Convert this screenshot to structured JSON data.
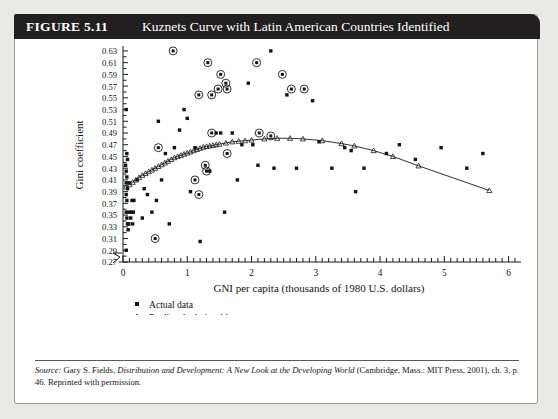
{
  "figure": {
    "number": "FIGURE 5.11",
    "title": "Kuznets Curve with Latin American Countries Identified"
  },
  "source": {
    "label": "Source:",
    "author": " Gary S. Fields, ",
    "work_italic": "Distribution and Development: A New Look at the Developing World",
    "rest": " (Cambridge, Mass.: MIT Press, 2001), ch. 3, p. 46. Reprinted with permission."
  },
  "legend": {
    "items": [
      {
        "marker": "square-marker",
        "label": "Actual data"
      },
      {
        "marker": "triangle-marker",
        "label": "Predicted relationship"
      },
      {
        "marker": "circled-square-marker",
        "label": "Latin American country"
      }
    ]
  },
  "colors": {
    "header_bg": "#211f1f",
    "header_text": "#ffffff",
    "axis": "#1a1a1a",
    "marker": "#141414",
    "page_bg": "#e9e9e7",
    "card_bg": "#ffffff"
  },
  "chart_data": {
    "type": "scatter",
    "title": "Kuznets Curve with Latin American Countries Identified",
    "xlabel": "GNI per capita (thousands of 1980 U.S. dollars)",
    "ylabel": "Gini coefficient",
    "xlim": [
      0,
      6.1
    ],
    "ylim": [
      0.27,
      0.635
    ],
    "xticks": [
      0,
      1,
      2,
      3,
      4,
      5,
      6
    ],
    "xtick_labels": [
      "0",
      "1",
      "2",
      "3",
      "4",
      "5",
      "6"
    ],
    "x_minor_tick_step": 0.1,
    "yticks": [
      0.27,
      0.29,
      0.31,
      0.33,
      0.35,
      0.37,
      0.39,
      0.41,
      0.43,
      0.45,
      0.47,
      0.49,
      0.51,
      0.53,
      0.55,
      0.57,
      0.59,
      0.61,
      0.63
    ],
    "ytick_labels": [
      "0.27",
      "0.29",
      "0.31",
      "0.33",
      "0.35",
      "0.37",
      "0.39",
      "0.41",
      "0.43",
      "0.45",
      "0.47",
      "0.49",
      "0.51",
      "0.53",
      "0.55",
      "0.57",
      "0.59",
      "0.61",
      "0.63"
    ],
    "grid": false,
    "axis_break_origin": true,
    "legend_position": "below-left",
    "series": [
      {
        "name": "Actual data",
        "marker": "square",
        "points": [
          [
            0.05,
            0.53
          ],
          [
            0.06,
            0.455
          ],
          [
            0.07,
            0.445
          ],
          [
            0.04,
            0.435
          ],
          [
            0.05,
            0.425
          ],
          [
            0.06,
            0.415
          ],
          [
            0.05,
            0.405
          ],
          [
            0.1,
            0.405
          ],
          [
            0.07,
            0.395
          ],
          [
            0.05,
            0.385
          ],
          [
            0.06,
            0.375
          ],
          [
            0.14,
            0.375
          ],
          [
            0.17,
            0.375
          ],
          [
            0.05,
            0.355
          ],
          [
            0.09,
            0.355
          ],
          [
            0.13,
            0.355
          ],
          [
            0.16,
            0.355
          ],
          [
            0.06,
            0.345
          ],
          [
            0.07,
            0.335
          ],
          [
            0.09,
            0.335
          ],
          [
            0.08,
            0.325
          ],
          [
            0.05,
            0.29
          ],
          [
            0.12,
            0.345
          ],
          [
            0.15,
            0.335
          ],
          [
            0.22,
            0.41
          ],
          [
            0.3,
            0.345
          ],
          [
            0.33,
            0.395
          ],
          [
            0.38,
            0.385
          ],
          [
            0.45,
            0.355
          ],
          [
            0.52,
            0.375
          ],
          [
            0.55,
            0.51
          ],
          [
            0.6,
            0.41
          ],
          [
            0.66,
            0.455
          ],
          [
            0.72,
            0.335
          ],
          [
            0.8,
            0.465
          ],
          [
            0.88,
            0.495
          ],
          [
            0.95,
            0.53
          ],
          [
            1.0,
            0.515
          ],
          [
            1.05,
            0.39
          ],
          [
            1.12,
            0.465
          ],
          [
            1.2,
            0.305
          ],
          [
            1.35,
            0.425
          ],
          [
            1.45,
            0.49
          ],
          [
            1.52,
            0.49
          ],
          [
            1.58,
            0.355
          ],
          [
            1.7,
            0.49
          ],
          [
            1.78,
            0.41
          ],
          [
            1.85,
            0.47
          ],
          [
            1.95,
            0.575
          ],
          [
            2.02,
            0.47
          ],
          [
            2.1,
            0.435
          ],
          [
            2.3,
            0.63
          ],
          [
            2.35,
            0.43
          ],
          [
            2.55,
            0.555
          ],
          [
            2.7,
            0.43
          ],
          [
            2.95,
            0.545
          ],
          [
            3.05,
            0.475
          ],
          [
            3.25,
            0.43
          ],
          [
            3.45,
            0.465
          ],
          [
            3.55,
            0.46
          ],
          [
            3.62,
            0.39
          ],
          [
            3.75,
            0.43
          ],
          [
            4.1,
            0.455
          ],
          [
            4.3,
            0.47
          ],
          [
            4.55,
            0.445
          ],
          [
            4.95,
            0.465
          ],
          [
            5.35,
            0.43
          ],
          [
            5.6,
            0.455
          ]
        ]
      },
      {
        "name": "Predicted relationship",
        "marker": "triangle",
        "line": true,
        "points": [
          [
            0.05,
            0.398
          ],
          [
            0.1,
            0.402
          ],
          [
            0.15,
            0.406
          ],
          [
            0.2,
            0.41
          ],
          [
            0.25,
            0.414
          ],
          [
            0.3,
            0.418
          ],
          [
            0.35,
            0.421
          ],
          [
            0.4,
            0.424
          ],
          [
            0.45,
            0.427
          ],
          [
            0.5,
            0.43
          ],
          [
            0.55,
            0.433
          ],
          [
            0.6,
            0.436
          ],
          [
            0.65,
            0.439
          ],
          [
            0.7,
            0.442
          ],
          [
            0.75,
            0.445
          ],
          [
            0.8,
            0.448
          ],
          [
            0.85,
            0.45
          ],
          [
            0.9,
            0.452
          ],
          [
            0.95,
            0.454
          ],
          [
            1.0,
            0.456
          ],
          [
            1.05,
            0.458
          ],
          [
            1.1,
            0.46
          ],
          [
            1.15,
            0.462
          ],
          [
            1.2,
            0.464
          ],
          [
            1.25,
            0.466
          ],
          [
            1.3,
            0.467
          ],
          [
            1.35,
            0.468
          ],
          [
            1.4,
            0.469
          ],
          [
            1.45,
            0.47
          ],
          [
            1.5,
            0.471
          ],
          [
            1.6,
            0.473
          ],
          [
            1.7,
            0.475
          ],
          [
            1.8,
            0.476
          ],
          [
            1.9,
            0.477
          ],
          [
            2.0,
            0.478
          ],
          [
            2.2,
            0.48
          ],
          [
            2.4,
            0.481
          ],
          [
            2.6,
            0.481
          ],
          [
            2.8,
            0.48
          ],
          [
            3.1,
            0.477
          ],
          [
            3.4,
            0.472
          ],
          [
            3.6,
            0.468
          ],
          [
            3.9,
            0.46
          ],
          [
            4.2,
            0.45
          ],
          [
            4.6,
            0.434
          ],
          [
            5.7,
            0.392
          ]
        ]
      },
      {
        "name": "Latin American country",
        "marker": "circled-square",
        "points": [
          [
            0.78,
            0.63
          ],
          [
            1.32,
            0.61
          ],
          [
            1.52,
            0.59
          ],
          [
            1.6,
            0.575
          ],
          [
            1.48,
            0.565
          ],
          [
            1.62,
            0.565
          ],
          [
            1.18,
            0.555
          ],
          [
            1.38,
            0.555
          ],
          [
            2.08,
            0.61
          ],
          [
            2.48,
            0.59
          ],
          [
            2.62,
            0.565
          ],
          [
            2.82,
            0.565
          ],
          [
            1.38,
            0.49
          ],
          [
            2.12,
            0.49
          ],
          [
            2.3,
            0.485
          ],
          [
            0.55,
            0.465
          ],
          [
            1.28,
            0.435
          ],
          [
            1.3,
            0.425
          ],
          [
            1.12,
            0.41
          ],
          [
            1.62,
            0.455
          ],
          [
            0.5,
            0.31
          ],
          [
            1.18,
            0.385
          ]
        ]
      }
    ]
  }
}
